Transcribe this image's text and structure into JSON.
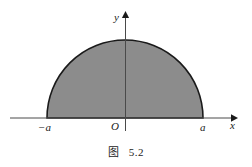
{
  "figure": {
    "caption_label": "图",
    "caption_number": "5.2",
    "background_color": "#ffffff"
  },
  "axes": {
    "y_label": "y",
    "x_label": "x",
    "origin_label": "O",
    "axis_color": "#4a4a4a",
    "arrow_color": "#1a1a1a"
  },
  "ticks": {
    "left_label": "−a",
    "right_label": "a"
  },
  "chart_data": {
    "type": "area",
    "xlabel": "x",
    "ylabel": "y",
    "shape": "semicircle",
    "center": [
      0,
      0
    ],
    "radius_label": "a",
    "x_domain": [
      "−a",
      "a"
    ],
    "y_domain": [
      0,
      "a"
    ],
    "fill_color": "#8c8c8c",
    "outline_color": "#1a1a1a",
    "grid": false,
    "legend": false,
    "annotations": [
      {
        "text": "−a",
        "x": "−a",
        "y": 0,
        "position": "below-axis"
      },
      {
        "text": "O",
        "x": 0,
        "y": 0,
        "position": "below-left-of-origin"
      },
      {
        "text": "a",
        "x": "a",
        "y": 0,
        "position": "below-axis"
      }
    ],
    "pixel_geometry": {
      "center_px": [
        125,
        118
      ],
      "radius_px": 78,
      "x_axis_y_px": 118,
      "y_axis_x_px": 125,
      "x_axis_span_px": [
        10,
        237
      ],
      "y_axis_span_px": [
        12,
        131
      ]
    }
  }
}
